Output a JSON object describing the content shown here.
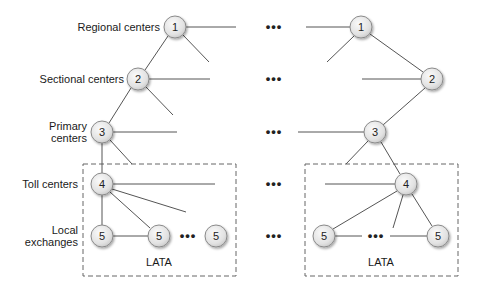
{
  "diagram": {
    "levels": [
      {
        "id": "regional",
        "label_lines": [
          "Regional centers"
        ],
        "node_number": "1"
      },
      {
        "id": "sectional",
        "label_lines": [
          "Sectional centers"
        ],
        "node_number": "2"
      },
      {
        "id": "primary",
        "label_lines": [
          "Primary",
          "centers"
        ],
        "node_number": "3"
      },
      {
        "id": "toll",
        "label_lines": [
          "Toll centers"
        ],
        "node_number": "4"
      },
      {
        "id": "local",
        "label_lines": [
          "Local",
          "exchanges"
        ],
        "node_number": "5"
      }
    ],
    "ellipsis": "•••",
    "lata_left_label": "LATA",
    "lata_right_label": "LATA",
    "colors": {
      "node_fill": "#e6e6e6",
      "node_stroke": "#8a8a8a",
      "edge": "#555555",
      "box": "#666666"
    },
    "left_tree": {
      "nodes": [
        {
          "n": "1",
          "x": 175,
          "y": 27
        },
        {
          "n": "2",
          "x": 138,
          "y": 79
        },
        {
          "n": "3",
          "x": 102,
          "y": 132
        },
        {
          "n": "4",
          "x": 102,
          "y": 184
        },
        {
          "n": "5",
          "x": 102,
          "y": 236
        },
        {
          "n": "5",
          "x": 159,
          "y": 236
        },
        {
          "n": "5",
          "x": 216,
          "y": 236
        }
      ]
    },
    "right_tree": {
      "nodes": [
        {
          "n": "1",
          "x": 361,
          "y": 27
        },
        {
          "n": "2",
          "x": 432,
          "y": 79
        },
        {
          "n": "3",
          "x": 375,
          "y": 132
        },
        {
          "n": "4",
          "x": 406,
          "y": 184
        },
        {
          "n": "5",
          "x": 324,
          "y": 236
        },
        {
          "n": "5",
          "x": 438,
          "y": 236
        }
      ]
    }
  }
}
